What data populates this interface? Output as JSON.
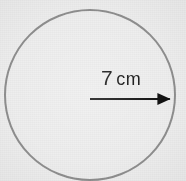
{
  "figure": {
    "kind": "circle-radius-diagram",
    "width": 186,
    "height": 181,
    "background_color": "#eeeeee",
    "caption_text": "7 cm"
  },
  "circle": {
    "name": "circle-outline",
    "center_x": 90,
    "center_y": 95,
    "radius": 85,
    "stroke_color": "#8f8f8f",
    "stroke_width": 2,
    "fill": "none"
  },
  "radius_arrow": {
    "name": "radius-arrow",
    "from_x": 90,
    "from_y": 99,
    "to_x": 175,
    "to_y": 99,
    "color": "#111111",
    "line_width": 2,
    "arrowhead": "solid-triangle"
  },
  "label": {
    "value": "7",
    "unit": "cm",
    "full_text": "7 cm",
    "color": "#111111",
    "x": 101,
    "y": 67
  }
}
